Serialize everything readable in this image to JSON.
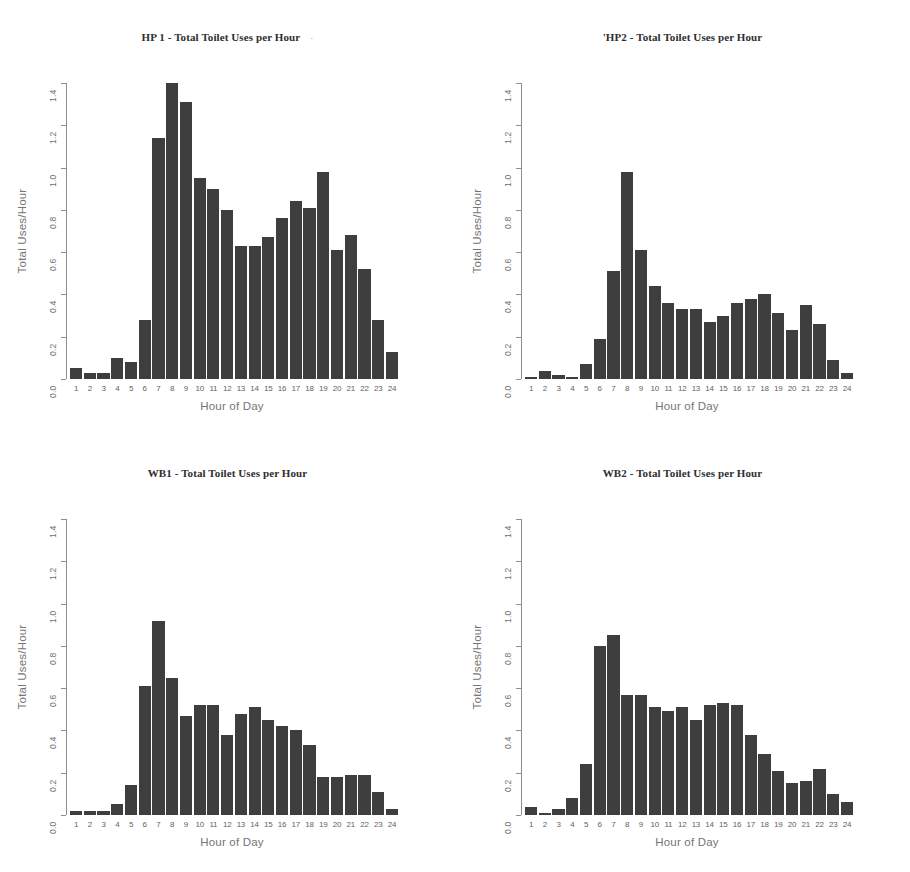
{
  "figure": {
    "background": "#ffffff",
    "bar_color": "#3e3e3e",
    "axis_color": "#8e8e8e",
    "panels": 4,
    "layout": "2x2"
  },
  "axis": {
    "ylabel": "Total Uses/Hour",
    "xlabel": "Hour of Day",
    "yticks": [
      "0.0",
      "0.2",
      "0.4",
      "0.6",
      "0.8",
      "1.0",
      "1.2",
      "1.4"
    ],
    "xticks": [
      "1",
      "2",
      "3",
      "4",
      "5",
      "6",
      "7",
      "8",
      "9",
      "10",
      "11",
      "12",
      "13",
      "14",
      "15",
      "16",
      "17",
      "18",
      "19",
      "20",
      "21",
      "22",
      "23",
      "24"
    ],
    "ymin": 0.0,
    "ymax": 1.4
  },
  "panels": [
    {
      "title": "HP 1 - Total Toilet Uses per Hour",
      "trailing_mark": "·"
    },
    {
      "title": "'HP2 - Total Toilet Uses per Hour",
      "trailing_mark": ""
    },
    {
      "title": "WB1 - Total Toilet Uses per Hour",
      "trailing_mark": ""
    },
    {
      "title": "WB2 - Total Toilet Uses per Hour",
      "trailing_mark": ""
    }
  ],
  "chart_data": [
    {
      "type": "bar",
      "title": "HP 1 - Total Toilet Uses per Hour",
      "xlabel": "Hour of Day",
      "ylabel": "Total Uses/Hour",
      "ylim": [
        0,
        1.4
      ],
      "grid": false,
      "legend": "none",
      "categories": [
        "1",
        "2",
        "3",
        "4",
        "5",
        "6",
        "7",
        "8",
        "9",
        "10",
        "11",
        "12",
        "13",
        "14",
        "15",
        "16",
        "17",
        "18",
        "19",
        "20",
        "21",
        "22",
        "23",
        "24"
      ],
      "values": [
        0.05,
        0.03,
        0.03,
        0.1,
        0.08,
        0.28,
        1.14,
        1.4,
        1.31,
        0.95,
        0.9,
        0.8,
        0.63,
        0.63,
        0.67,
        0.76,
        0.84,
        0.81,
        0.98,
        0.61,
        0.68,
        0.52,
        0.28,
        0.13
      ]
    },
    {
      "type": "bar",
      "title": "'HP2 - Total Toilet Uses per Hour",
      "xlabel": "Hour of Day",
      "ylabel": "Total Uses/Hour",
      "ylim": [
        0,
        1.4
      ],
      "grid": false,
      "legend": "none",
      "categories": [
        "1",
        "2",
        "3",
        "4",
        "5",
        "6",
        "7",
        "8",
        "9",
        "10",
        "11",
        "12",
        "13",
        "14",
        "15",
        "16",
        "17",
        "18",
        "19",
        "20",
        "21",
        "22",
        "23",
        "24"
      ],
      "values": [
        0.01,
        0.04,
        0.02,
        0.01,
        0.07,
        0.19,
        0.51,
        0.98,
        0.61,
        0.44,
        0.36,
        0.33,
        0.33,
        0.27,
        0.3,
        0.36,
        0.38,
        0.4,
        0.31,
        0.23,
        0.35,
        0.26,
        0.09,
        0.03
      ]
    },
    {
      "type": "bar",
      "title": "WB1 - Total Toilet Uses per Hour",
      "xlabel": "Hour of Day",
      "ylabel": "Total Uses/Hour",
      "ylim": [
        0,
        1.4
      ],
      "grid": false,
      "legend": "none",
      "categories": [
        "1",
        "2",
        "3",
        "4",
        "5",
        "6",
        "7",
        "8",
        "9",
        "10",
        "11",
        "12",
        "13",
        "14",
        "15",
        "16",
        "17",
        "18",
        "19",
        "20",
        "21",
        "22",
        "23",
        "24"
      ],
      "values": [
        0.02,
        0.02,
        0.02,
        0.05,
        0.14,
        0.61,
        0.92,
        0.65,
        0.47,
        0.52,
        0.52,
        0.38,
        0.48,
        0.51,
        0.45,
        0.42,
        0.4,
        0.33,
        0.18,
        0.18,
        0.19,
        0.19,
        0.11,
        0.03
      ]
    },
    {
      "type": "bar",
      "title": "WB2 - Total Toilet Uses per Hour",
      "xlabel": "Hour of Day",
      "ylabel": "Total Uses/Hour",
      "ylim": [
        0,
        1.4
      ],
      "grid": false,
      "legend": "none",
      "categories": [
        "1",
        "2",
        "3",
        "4",
        "5",
        "6",
        "7",
        "8",
        "9",
        "10",
        "11",
        "12",
        "13",
        "14",
        "15",
        "16",
        "17",
        "18",
        "19",
        "20",
        "21",
        "22",
        "23",
        "24"
      ],
      "values": [
        0.04,
        0.01,
        0.03,
        0.08,
        0.24,
        0.8,
        0.85,
        0.57,
        0.57,
        0.51,
        0.49,
        0.51,
        0.45,
        0.52,
        0.53,
        0.52,
        0.38,
        0.29,
        0.21,
        0.15,
        0.16,
        0.22,
        0.1,
        0.06
      ]
    }
  ]
}
